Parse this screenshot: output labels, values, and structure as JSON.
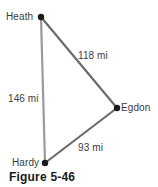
{
  "figure": {
    "caption": "Figure 5-46",
    "background_color": "#ffffff",
    "text_color": "#3b3b3b",
    "caption_color": "#1a1a1a"
  },
  "diagram": {
    "type": "triangle-distance-map",
    "vertex_dot_color": "#1a1a1a",
    "edge_colors": {
      "light": "#9a9a9a",
      "dark": "#6b6b6b"
    },
    "vertices": [
      {
        "id": "heath",
        "label": "Heath",
        "x": 41,
        "y": 17
      },
      {
        "id": "egdon",
        "label": "Egdon",
        "x": 117,
        "y": 108
      },
      {
        "id": "hardy",
        "label": "Hardy",
        "x": 45,
        "y": 163
      }
    ],
    "edges": [
      {
        "id": "heath-egdon",
        "from": "heath",
        "to": "egdon",
        "label": "118 mi",
        "value": 118,
        "unit": "mi"
      },
      {
        "id": "heath-hardy",
        "from": "heath",
        "to": "hardy",
        "label": "146 mi",
        "value": 146,
        "unit": "mi"
      },
      {
        "id": "hardy-egdon",
        "from": "hardy",
        "to": "egdon",
        "label": "93 mi",
        "value": 93,
        "unit": "mi"
      }
    ]
  }
}
